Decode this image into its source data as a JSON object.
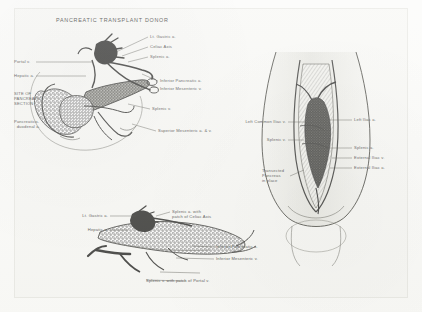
{
  "figure": {
    "title": "PANCREATIC TRANSPLANT DONOR",
    "background_color": "#f7f7f4",
    "ink_color": "#1c1c1a",
    "page_color": "#fbfbf9"
  },
  "panels": [
    {
      "id": "panel-donor-organ",
      "name": "donor-pancreas-en-bloc-view",
      "labels": [
        {
          "key": "lt_gastric_a",
          "text": "Lt. Gastric a.",
          "align": "left"
        },
        {
          "key": "celiac_axis",
          "text": "Celiac Axis",
          "align": "left"
        },
        {
          "key": "splenic_a",
          "text": "Splenic a.",
          "align": "left"
        },
        {
          "key": "portal_v",
          "text": "Portal v.",
          "align": "left"
        },
        {
          "key": "hepatic_a",
          "text": "Hepatic a.",
          "align": "left"
        },
        {
          "key": "site_of_pancreatic_section",
          "text": "SITE OF\nPANCREATIC\nSECTION",
          "align": "left"
        },
        {
          "key": "pancreaticoduodenal_a",
          "text": "Pancreatico-\n  duodenal a.",
          "align": "left"
        },
        {
          "key": "inferior_pancreatic_a",
          "text": "Inferior Pancreatic a.",
          "align": "left"
        },
        {
          "key": "inferior_mesenteric_v",
          "text": "Inferior Mesenteric v.",
          "align": "left"
        },
        {
          "key": "splenic_v",
          "text": "Splenic v.",
          "align": "left"
        },
        {
          "key": "superior_mesenteric_av",
          "text": "Superior Mesenteric a. & v.",
          "align": "left"
        }
      ]
    },
    {
      "id": "panel-recipient-pelvis",
      "name": "transplanted-pancreas-in-pelvis-view",
      "labels": [
        {
          "key": "left_common_iliac_v",
          "text": "Left Common Iliac v.",
          "align": "right"
        },
        {
          "key": "left_iliac_a",
          "text": "Left Iliac a.",
          "align": "left"
        },
        {
          "key": "splenic_v_pelvis",
          "text": "Splenic v.",
          "align": "right"
        },
        {
          "key": "splenic_a_pelvis",
          "text": "Splenic a.",
          "align": "left"
        },
        {
          "key": "external_iliac_v",
          "text": "External Iliac v.",
          "align": "left"
        },
        {
          "key": "external_iliac_a",
          "text": "External Iliac a.",
          "align": "left"
        },
        {
          "key": "transected_pancreas_in_place",
          "text": "Transected\nPancreas\nin place",
          "align": "left"
        }
      ]
    },
    {
      "id": "panel-graft-detail",
      "name": "isolated-pancreas-graft-view",
      "labels": [
        {
          "key": "lt_gastric_a_graft",
          "text": "Lt. Gastric a.",
          "align": "right"
        },
        {
          "key": "hepatic_a_graft",
          "text": "Hepatic a.",
          "align": "right"
        },
        {
          "key": "splenic_a_with_patch",
          "text": "Splenic a. with\npatch of Celiac Axis",
          "align": "left"
        },
        {
          "key": "inferior_pancreatic_a_graft",
          "text": "Inferior Pancreatic a.",
          "align": "left"
        },
        {
          "key": "inferior_mesenteric_v_graft",
          "text": "Inferior Mesenteric v.",
          "align": "left"
        },
        {
          "key": "splenic_v_with_patch",
          "text": "Splenic v. with patch of Portal v.",
          "align": "left"
        }
      ]
    }
  ]
}
